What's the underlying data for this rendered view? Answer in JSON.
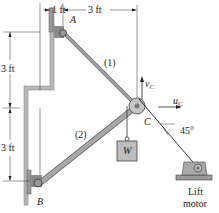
{
  "diagram": {
    "dimensions": {
      "top_left": "1 ft",
      "top_right": "3 ft",
      "left_upper": "3 ft",
      "left_lower": "3 ft"
    },
    "points": {
      "A": "A",
      "B": "B",
      "C": "C"
    },
    "members": {
      "member1": "(1)",
      "member2": "(2)"
    },
    "velocity": {
      "v": "v",
      "v_sub": "C",
      "u": "u",
      "u_sub": "C"
    },
    "angle": "45°",
    "weight": "W",
    "motor": {
      "line1": "Lift",
      "line2": "motor"
    },
    "colors": {
      "wall": "#b8b8b8",
      "member": "#a8a8a8",
      "line": "#333333",
      "bracket": "#8a8a8a"
    }
  }
}
